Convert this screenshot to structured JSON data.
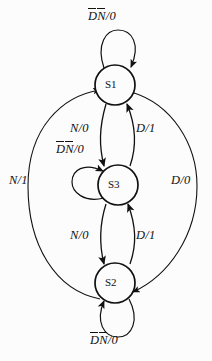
{
  "diagram": {
    "states": [
      {
        "id": "s1",
        "label": "S1",
        "cx": 115,
        "cy": 85,
        "r": 20
      },
      {
        "id": "s3",
        "label": "S3",
        "cx": 118,
        "cy": 185,
        "r": 20
      },
      {
        "id": "s2",
        "label": "S2",
        "cx": 115,
        "cy": 283,
        "r": 20
      }
    ],
    "self_loops": [
      {
        "id": "loop-s1",
        "state": "S1",
        "label_d": "D",
        "label_n": "N",
        "label_out": "/0",
        "position": "top"
      },
      {
        "id": "loop-s3",
        "state": "S3",
        "label_d": "D",
        "label_n": "N",
        "label_out": "/0",
        "position": "left"
      },
      {
        "id": "loop-s2",
        "state": "S2",
        "label_d": "D",
        "label_n": "N",
        "label_out": "/0",
        "position": "bottom"
      }
    ],
    "transitions": [
      {
        "id": "s1-s3",
        "from": "S1",
        "to": "S3",
        "label": "N/0"
      },
      {
        "id": "s3-s1",
        "from": "S3",
        "to": "S1",
        "label": "D/1"
      },
      {
        "id": "s3-s2",
        "from": "S3",
        "to": "S2",
        "label": "N/0"
      },
      {
        "id": "s2-s3",
        "from": "S2",
        "to": "S3",
        "label": "D/1"
      },
      {
        "id": "s2-s1",
        "from": "S2",
        "to": "S1",
        "label": "N/1"
      },
      {
        "id": "s1-s2",
        "from": "S1",
        "to": "S2",
        "label": "D/0"
      }
    ],
    "colors": {
      "line": "#111111",
      "text": "#111111",
      "background": "#fcfcfc"
    }
  }
}
